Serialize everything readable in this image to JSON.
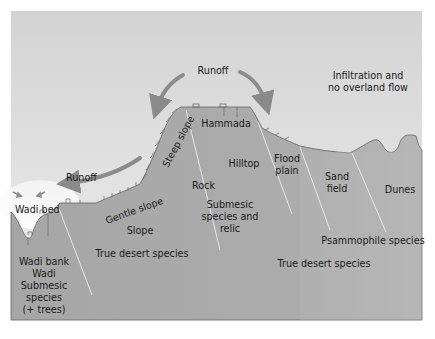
{
  "diagram": {
    "colors": {
      "sky_top": "#d4d4d4",
      "sky_bottom": "#ececec",
      "ground": "#a8a8a8",
      "ground_right": "#b4b4b4",
      "outline": "#6e6e6e",
      "arrow": "#8c8c8c",
      "divider": "#e6e6e6",
      "text": "#1a1a1a"
    },
    "flows": {
      "runoff_top": "Runoff",
      "runoff_left": "Runoff",
      "infiltration_line1": "Infiltration and",
      "infiltration_line2": "no overland flow"
    },
    "landforms": {
      "wadi_bed": "Wadi bed",
      "gentle_slope": "Gentle slope",
      "steep_slope": "Steep slope",
      "hammada": "Hammada",
      "rock": "Rock",
      "hilltop": "Hilltop",
      "flood_plain_line1": "Flood",
      "flood_plain_line2": "plain",
      "sand_field_line1": "Sand",
      "sand_field_line2": "field",
      "dunes": "Dunes"
    },
    "zones": {
      "wadi_line1": "Wadi bank",
      "wadi_line2": "Wadi",
      "wadi_line3": "Submesic",
      "wadi_line4": "species",
      "wadi_line5": "(+ trees)",
      "slope": "Slope",
      "slope_species": "True desert species",
      "hilltop_line1": "Submesic",
      "hilltop_line2": "species and",
      "hilltop_line3": "relic",
      "psammophile": "Psammophile species",
      "plain_species": "True desert species"
    }
  }
}
